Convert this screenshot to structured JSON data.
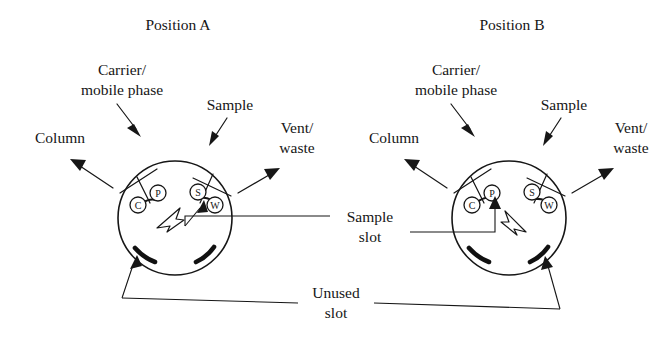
{
  "figure": {
    "caption_absent": true,
    "background_color": "#ffffff",
    "ink_color": "#161616"
  },
  "panels": [
    {
      "id": "position-a",
      "title": "Position A",
      "labels": {
        "carrier": "Carrier/",
        "carrier_line2": "mobile phase",
        "sample": "Sample",
        "column": "Column",
        "vent": "Vent/",
        "vent_line2": "waste"
      },
      "ports": [
        {
          "letter": "C",
          "name": "column-port"
        },
        {
          "letter": "P",
          "name": "carrier-port"
        },
        {
          "letter": "S",
          "name": "sample-port"
        },
        {
          "letter": "W",
          "name": "waste-port"
        }
      ],
      "rotor_connection": "S-W",
      "pointer_direction": "up-right"
    },
    {
      "id": "position-b",
      "title": "Position B",
      "labels": {
        "carrier": "Carrier/",
        "carrier_line2": "mobile phase",
        "sample": "Sample",
        "column": "Column",
        "vent": "Vent/",
        "vent_line2": "waste"
      },
      "ports": [
        {
          "letter": "C",
          "name": "column-port"
        },
        {
          "letter": "P",
          "name": "carrier-port"
        },
        {
          "letter": "S",
          "name": "sample-port"
        },
        {
          "letter": "W",
          "name": "waste-port"
        }
      ],
      "rotor_connection": "C-P",
      "pointer_direction": "up-left"
    }
  ],
  "annotations": {
    "sample_slot": "Sample",
    "sample_slot_line2": "slot",
    "unused_slot": "Unused",
    "unused_slot_line2": "slot"
  }
}
